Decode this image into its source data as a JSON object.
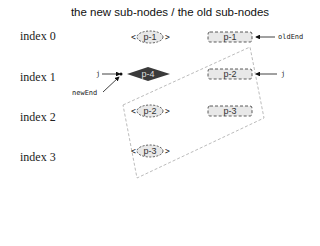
{
  "title": "the new sub-nodes  /  the old sub-nodes",
  "index_labels": [
    "index 0",
    "index 1",
    "index 2",
    "index 3"
  ],
  "new_nodes": [
    {
      "index": 0,
      "label": "p-1",
      "style": "dashed-ellipse"
    },
    {
      "index": 1,
      "label": "p-4",
      "style": "filled-diamond"
    },
    {
      "index": 2,
      "label": "p-2",
      "style": "dashed-ellipse"
    },
    {
      "index": 3,
      "label": "p-3",
      "style": "dashed-ellipse"
    }
  ],
  "old_nodes": [
    {
      "index": 0,
      "label": "p-1",
      "style": "dashed-rect"
    },
    {
      "index": 1,
      "label": "p-2",
      "style": "dashed-rect"
    },
    {
      "index": 2,
      "label": "p-3",
      "style": "dashed-rect"
    }
  ],
  "pointers": {
    "old_end": "oldEnd",
    "old_j": "j",
    "new_j": "j",
    "new_end": "newEnd"
  },
  "colors": {
    "diamond_fill": "#3a3a3a",
    "node_fill": "#e8e8e8",
    "region_stroke": "#aaaaaa"
  }
}
